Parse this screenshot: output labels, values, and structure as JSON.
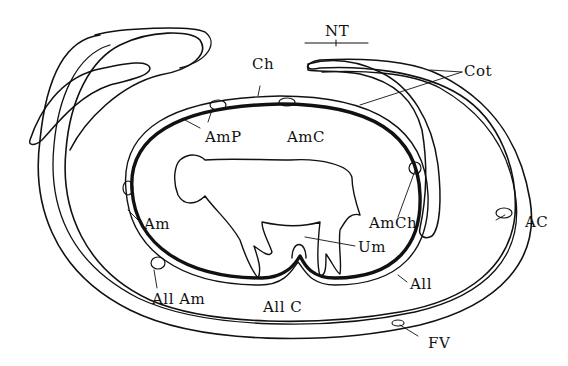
{
  "figure": {
    "colors": {
      "ink": "#111111",
      "background": "#ffffff"
    },
    "labels": {
      "nt": "NT",
      "ch": "Ch",
      "cot": "Cot",
      "amp": "AmP",
      "amc": "AmC",
      "amch": "AmCh",
      "ac": "AC",
      "am": "Am",
      "um": "Um",
      "all": "All",
      "all_am": "All Am",
      "all_c": "All C",
      "fv": "FV"
    }
  }
}
